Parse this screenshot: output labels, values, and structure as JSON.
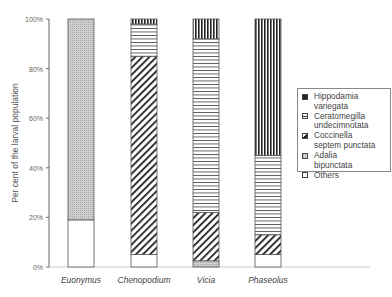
{
  "chart_data": {
    "type": "bar",
    "stacked": true,
    "title": "",
    "xlabel": "",
    "ylabel": "Per cent of the larval population",
    "ylim": [
      0,
      100
    ],
    "yticks": [
      "0%",
      "20%",
      "40%",
      "60%",
      "80%",
      "100%"
    ],
    "categories": [
      "Euonymus",
      "Chenopodium",
      "Vicia",
      "Phaseolus"
    ],
    "series": [
      {
        "name": "Others",
        "pattern": "white",
        "values": [
          19,
          5,
          0,
          5
        ]
      },
      {
        "name": "Adalia bipunctata",
        "pattern": "dots",
        "values": [
          81,
          0,
          2.5,
          0
        ]
      },
      {
        "name": "Coccinella septem punctata",
        "pattern": "diagonal",
        "values": [
          0,
          80,
          19.5,
          8
        ]
      },
      {
        "name": "Ceratomegilla undecimnotata",
        "pattern": "horizontal",
        "values": [
          0,
          13,
          70,
          32
        ]
      },
      {
        "name": "Hippodamia variegata",
        "pattern": "vertical",
        "values": [
          0,
          2,
          8,
          55
        ]
      }
    ],
    "grid": false,
    "legend_position": "right"
  },
  "legend": {
    "items": [
      {
        "label": "Hippodamia\nvariegata",
        "pattern": "vertical"
      },
      {
        "label": "Ceratomegilla\nundecimnotata",
        "pattern": "horizontal"
      },
      {
        "label": "Coccinella\nseptem punctata",
        "pattern": "diagonal"
      },
      {
        "label": "Adalia\nbipunctata",
        "pattern": "dots"
      },
      {
        "label": "Others",
        "pattern": "white"
      }
    ]
  }
}
